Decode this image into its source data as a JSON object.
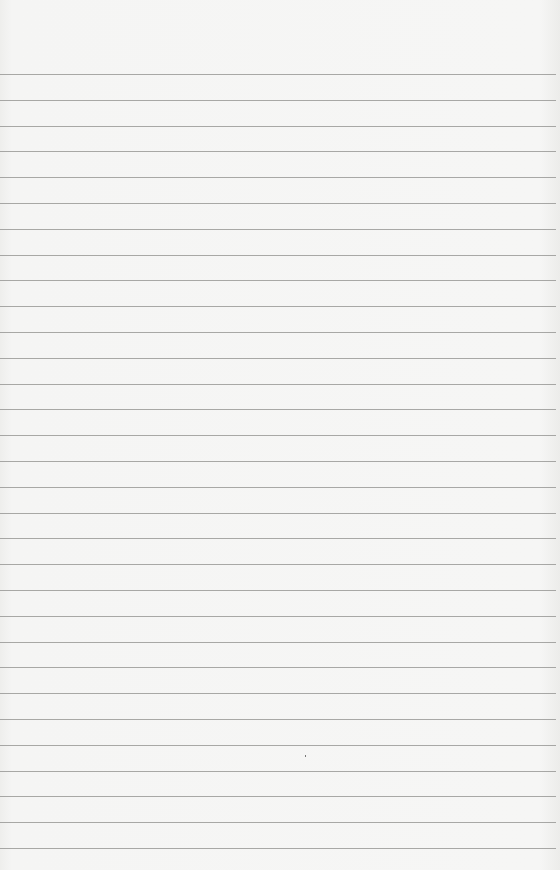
{
  "paper": {
    "type": "lined notebook paper",
    "background_color": "#f3f3f2",
    "line_color": "#8d8d8b",
    "first_line_y": 74,
    "line_spacing": 25.8,
    "line_count": 31
  }
}
